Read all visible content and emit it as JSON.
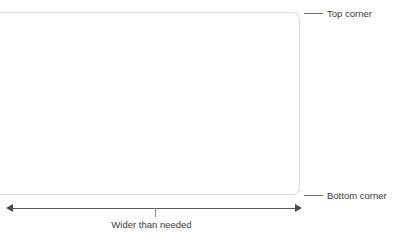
{
  "diagram": {
    "background_color": "#ffffff",
    "shape": {
      "name": "rounded-rectangle",
      "fill_color": "#ffffff",
      "stroke_color": "#dcdcdc",
      "corner_radius_px": 7,
      "clipped_edge": "left"
    },
    "callouts": [
      {
        "id": "top-corner",
        "label": "Top corner",
        "leader_color": "#707070",
        "text_color": "#3a3a3a"
      },
      {
        "id": "bottom-corner",
        "label": "Bottom corner",
        "leader_color": "#707070",
        "text_color": "#3a3a3a"
      }
    ],
    "dimension": {
      "id": "width-dimension",
      "label": "Wider than needed",
      "line_color": "#5a5a5a",
      "arrowhead_color": "#4a4a4a",
      "tick_color": "#8a8a8a",
      "text_color": "#3a3a3a",
      "arrow_style": "double-headed"
    }
  }
}
